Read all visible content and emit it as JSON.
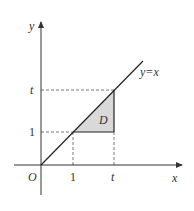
{
  "diagram": {
    "axes": {
      "x_label": "x",
      "y_label": "y",
      "origin_label": "O"
    },
    "ticks": {
      "x": [
        "1",
        "t"
      ],
      "y": [
        "1",
        "t"
      ]
    },
    "line_label": "y=x",
    "region_label": "D",
    "colors": {
      "axis": "#333333",
      "line": "#222222",
      "region_fill": "#d9d9d9",
      "dashed": "#555555",
      "background": "#ffffff"
    }
  }
}
